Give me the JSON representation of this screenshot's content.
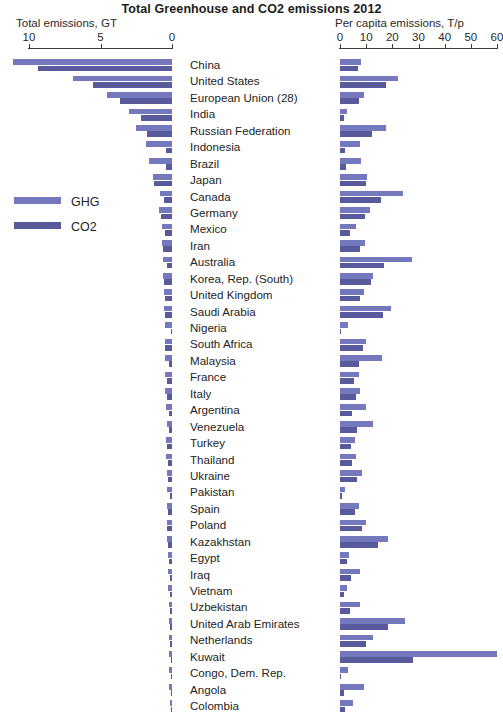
{
  "title": "Total Greenhouse and CO2 emissions 2012",
  "left_axis": {
    "caption": "Total emissions, GT",
    "ticks": [
      "10",
      "5",
      "0"
    ],
    "tick_values": [
      10,
      5,
      0
    ]
  },
  "right_axis": {
    "caption": "Per capita emissions, T/p",
    "ticks": [
      "0",
      "10",
      "20",
      "30",
      "40",
      "50",
      "60"
    ],
    "tick_values": [
      0,
      10,
      20,
      30,
      40,
      50,
      60
    ]
  },
  "legend": {
    "items": [
      {
        "label": "GHG",
        "color": "#7479bd"
      },
      {
        "label": "CO2",
        "color": "#585a9c"
      }
    ]
  },
  "chart_data": {
    "type": "bar",
    "title": "Total Greenhouse and CO2 emissions 2012",
    "orientation": "horizontal",
    "panels": [
      {
        "name": "total",
        "xlabel": "Total emissions, GT",
        "xlim": [
          10,
          0
        ],
        "reversed": true,
        "ticks": [
          10,
          5,
          0
        ]
      },
      {
        "name": "per_capita",
        "xlabel": "Per capita emissions, T/p",
        "xlim": [
          0,
          60
        ],
        "reversed": false,
        "ticks": [
          0,
          10,
          20,
          30,
          40,
          50,
          60
        ]
      }
    ],
    "series": [
      {
        "name": "GHG",
        "color": "#7479bd"
      },
      {
        "name": "CO2",
        "color": "#585a9c"
      }
    ],
    "categories": [
      "China",
      "United States",
      "European Union (28)",
      "India",
      "Russian Federation",
      "Indonesia",
      "Brazil",
      "Japan",
      "Canada",
      "Germany",
      "Mexico",
      "Iran",
      "Australia",
      "Korea, Rep. (South)",
      "United Kingdom",
      "Saudi Arabia",
      "Nigeria",
      "South Africa",
      "Malaysia",
      "France",
      "Italy",
      "Argentina",
      "Venezuela",
      "Turkey",
      "Thailand",
      "Ukraine",
      "Pakistan",
      "Spain",
      "Poland",
      "Kazakhstan",
      "Egypt",
      "Iraq",
      "Vietnam",
      "Uzbekistan",
      "United Arab Emirates",
      "Netherlands",
      "Kuwait",
      "Congo, Dem. Rep.",
      "Angola",
      "Colombia"
    ],
    "rows": [
      {
        "country": "China",
        "total_ghg": 11.1,
        "total_co2": 9.4,
        "pc_ghg": 8.2,
        "pc_co2": 6.7
      },
      {
        "country": "United States",
        "total_ghg": 6.9,
        "total_co2": 5.55,
        "pc_ghg": 22.0,
        "pc_co2": 17.5
      },
      {
        "country": "European Union (28)",
        "total_ghg": 4.55,
        "total_co2": 3.65,
        "pc_ghg": 9.0,
        "pc_co2": 7.2
      },
      {
        "country": "India",
        "total_ghg": 3.0,
        "total_co2": 2.2,
        "pc_ghg": 2.5,
        "pc_co2": 1.6
      },
      {
        "country": "Russian Federation",
        "total_ghg": 2.55,
        "total_co2": 1.75,
        "pc_ghg": 17.5,
        "pc_co2": 12.2
      },
      {
        "country": "Indonesia",
        "total_ghg": 1.85,
        "total_co2": 0.45,
        "pc_ghg": 7.5,
        "pc_co2": 1.9
      },
      {
        "country": "Brazil",
        "total_ghg": 1.6,
        "total_co2": 0.45,
        "pc_ghg": 8.0,
        "pc_co2": 2.3
      },
      {
        "country": "Japan",
        "total_ghg": 1.35,
        "total_co2": 1.25,
        "pc_ghg": 10.5,
        "pc_co2": 9.8
      },
      {
        "country": "Canada",
        "total_ghg": 0.85,
        "total_co2": 0.55,
        "pc_ghg": 24.0,
        "pc_co2": 15.5
      },
      {
        "country": "Germany",
        "total_ghg": 0.93,
        "total_co2": 0.78,
        "pc_ghg": 11.5,
        "pc_co2": 9.6
      },
      {
        "country": "Mexico",
        "total_ghg": 0.72,
        "total_co2": 0.47,
        "pc_ghg": 6.0,
        "pc_co2": 3.9
      },
      {
        "country": "Iran",
        "total_ghg": 0.72,
        "total_co2": 0.6,
        "pc_ghg": 9.4,
        "pc_co2": 7.8
      },
      {
        "country": "Australia",
        "total_ghg": 0.63,
        "total_co2": 0.38,
        "pc_ghg": 27.5,
        "pc_co2": 16.8
      },
      {
        "country": "Korea, Rep. (South)",
        "total_ghg": 0.62,
        "total_co2": 0.59,
        "pc_ghg": 12.5,
        "pc_co2": 11.8
      },
      {
        "country": "United Kingdom",
        "total_ghg": 0.58,
        "total_co2": 0.48,
        "pc_ghg": 9.0,
        "pc_co2": 7.5
      },
      {
        "country": "Saudi Arabia",
        "total_ghg": 0.58,
        "total_co2": 0.48,
        "pc_ghg": 19.5,
        "pc_co2": 16.5
      },
      {
        "country": "Nigeria",
        "total_ghg": 0.52,
        "total_co2": 0.07,
        "pc_ghg": 3.0,
        "pc_co2": 0.5
      },
      {
        "country": "South Africa",
        "total_ghg": 0.51,
        "total_co2": 0.46,
        "pc_ghg": 9.8,
        "pc_co2": 8.8
      },
      {
        "country": "Malaysia",
        "total_ghg": 0.48,
        "total_co2": 0.21,
        "pc_ghg": 16.0,
        "pc_co2": 7.2
      },
      {
        "country": "France",
        "total_ghg": 0.47,
        "total_co2": 0.34,
        "pc_ghg": 7.2,
        "pc_co2": 5.2
      },
      {
        "country": "Italy",
        "total_ghg": 0.46,
        "total_co2": 0.38,
        "pc_ghg": 7.5,
        "pc_co2": 6.3
      },
      {
        "country": "Argentina",
        "total_ghg": 0.42,
        "total_co2": 0.19,
        "pc_ghg": 10.0,
        "pc_co2": 4.6
      },
      {
        "country": "Venezuela",
        "total_ghg": 0.37,
        "total_co2": 0.19,
        "pc_ghg": 12.5,
        "pc_co2": 6.4
      },
      {
        "country": "Turkey",
        "total_ghg": 0.43,
        "total_co2": 0.32,
        "pc_ghg": 5.8,
        "pc_co2": 4.3
      },
      {
        "country": "Thailand",
        "total_ghg": 0.41,
        "total_co2": 0.3,
        "pc_ghg": 6.0,
        "pc_co2": 4.4
      },
      {
        "country": "Ukraine",
        "total_ghg": 0.38,
        "total_co2": 0.29,
        "pc_ghg": 8.4,
        "pc_co2": 6.4
      },
      {
        "country": "Pakistan",
        "total_ghg": 0.36,
        "total_co2": 0.16,
        "pc_ghg": 2.0,
        "pc_co2": 0.9
      },
      {
        "country": "Spain",
        "total_ghg": 0.34,
        "total_co2": 0.27,
        "pc_ghg": 7.3,
        "pc_co2": 5.8
      },
      {
        "country": "Poland",
        "total_ghg": 0.38,
        "total_co2": 0.32,
        "pc_ghg": 10.0,
        "pc_co2": 8.3
      },
      {
        "country": "Kazakhstan",
        "total_ghg": 0.32,
        "total_co2": 0.25,
        "pc_ghg": 18.5,
        "pc_co2": 14.5
      },
      {
        "country": "Egypt",
        "total_ghg": 0.29,
        "total_co2": 0.21,
        "pc_ghg": 3.5,
        "pc_co2": 2.6
      },
      {
        "country": "Iraq",
        "total_ghg": 0.26,
        "total_co2": 0.14,
        "pc_ghg": 7.7,
        "pc_co2": 4.2
      },
      {
        "country": "Vietnam",
        "total_ghg": 0.25,
        "total_co2": 0.15,
        "pc_ghg": 2.8,
        "pc_co2": 1.7
      },
      {
        "country": "Uzbekistan",
        "total_ghg": 0.22,
        "total_co2": 0.11,
        "pc_ghg": 7.5,
        "pc_co2": 3.7
      },
      {
        "country": "United Arab Emirates",
        "total_ghg": 0.23,
        "total_co2": 0.17,
        "pc_ghg": 25.0,
        "pc_co2": 18.5
      },
      {
        "country": "Netherlands",
        "total_ghg": 0.21,
        "total_co2": 0.16,
        "pc_ghg": 12.5,
        "pc_co2": 9.8
      },
      {
        "country": "Kuwait",
        "total_ghg": 0.21,
        "total_co2": 0.09,
        "pc_ghg": 60.0,
        "pc_co2": 28.0
      },
      {
        "country": "Congo, Dem. Rep.",
        "total_ghg": 0.2,
        "total_co2": 0.01,
        "pc_ghg": 3.0,
        "pc_co2": 0.1
      },
      {
        "country": "Angola",
        "total_ghg": 0.18,
        "total_co2": 0.03,
        "pc_ghg": 9.0,
        "pc_co2": 1.5
      },
      {
        "country": "Colombia",
        "total_ghg": 0.16,
        "total_co2": 0.07,
        "pc_ghg": 5.0,
        "pc_co2": 1.8
      }
    ]
  }
}
